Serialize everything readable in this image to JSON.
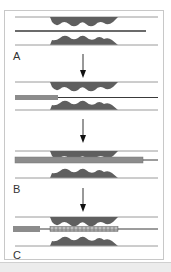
{
  "figure": {
    "panels": [
      {
        "id": "A",
        "label": "A",
        "description": "Guidewire crossing stenosis"
      },
      {
        "id": "intermediate",
        "label": "",
        "description": "Balloon catheter advanced over guidewire"
      },
      {
        "id": "B",
        "label": "B",
        "description": "Balloon inflated across stenosis"
      },
      {
        "id": "C",
        "label": "C",
        "description": "Stent deployed across stenosis"
      }
    ],
    "icons": [
      "down-arrow",
      "down-arrow",
      "down-arrow"
    ],
    "colors": {
      "plaque": "#5f5f5f",
      "vessel_wall": "#9a9a9a",
      "guidewire": "#3a3a3a",
      "catheter": "#8c8c8c",
      "stent": "#a8a8a8",
      "frame_border": "#c8c8c8"
    }
  }
}
